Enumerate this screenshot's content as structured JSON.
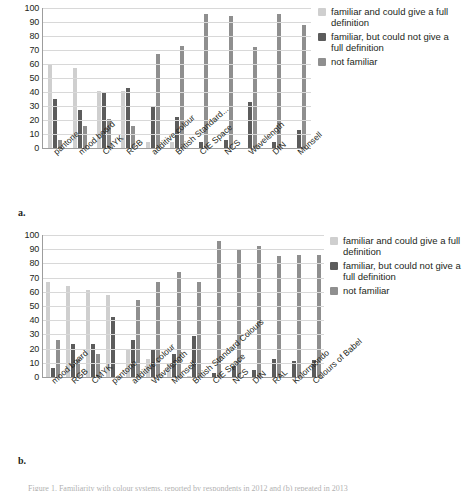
{
  "figure": {
    "panel_a_label": "a.",
    "panel_b_label": "b.",
    "caption": "Figure 1. Familiarity with colour systems, reported by respondents in 2012 and (b) repeated in 2013"
  },
  "legend": {
    "series": [
      {
        "label": "familiar and could give a full definition",
        "color": "#cfcfcf"
      },
      {
        "label": "familiar, but could not give a full definition",
        "color": "#5c5c5c"
      },
      {
        "label": "not familiar",
        "color": "#8f8f8f"
      }
    ]
  },
  "yaxis": {
    "ticks": [
      "100",
      "90",
      "80",
      "70",
      "60",
      "50",
      "40",
      "30",
      "20",
      "10",
      "0"
    ]
  },
  "chart_data": [
    {
      "type": "bar",
      "title": "",
      "panel": "a",
      "xlabel": "",
      "ylabel": "",
      "ylim": [
        0,
        100
      ],
      "grid": true,
      "legend_position": "right",
      "categories": [
        "pantone",
        "mood board",
        "CMYK",
        "RGB",
        "additive colour",
        "British Standard...",
        "CIE Space",
        "NCS",
        "Wavelength",
        "DIN",
        "Munsell"
      ],
      "series": [
        {
          "name": "familiar and could give a full definition",
          "color": "#cfcfcf",
          "values": [
            59,
            57,
            41,
            41,
            4,
            4,
            0,
            0,
            0,
            0,
            0
          ]
        },
        {
          "name": "familiar, but could not give a full definition",
          "color": "#5c5c5c",
          "values": [
            35,
            27,
            39,
            43,
            29,
            22,
            4,
            6,
            33,
            4,
            13
          ]
        },
        {
          "name": "not familiar",
          "color": "#8f8f8f",
          "values": [
            6,
            16,
            21,
            16,
            67,
            73,
            96,
            94,
            72,
            96,
            88
          ]
        }
      ]
    },
    {
      "type": "bar",
      "title": "",
      "panel": "b",
      "xlabel": "",
      "ylabel": "",
      "ylim": [
        0,
        100
      ],
      "grid": true,
      "legend_position": "right",
      "categories": [
        "mood board",
        "RGB",
        "CMYK",
        "pantone",
        "additive colour",
        "Wavelength",
        "Munsell",
        "British Standard Colours",
        "CIE Space",
        "NCS",
        "DIN",
        "RAL",
        "Kolormondo",
        "Colours of Babel"
      ],
      "series": [
        {
          "name": "familiar and could give a full definition",
          "color": "#cfcfcf",
          "values": [
            67,
            64,
            61,
            58,
            20,
            13,
            9,
            1,
            0,
            0,
            0,
            0,
            0,
            0
          ]
        },
        {
          "name": "familiar, but could not give a full definition",
          "color": "#5c5c5c",
          "values": [
            6,
            23,
            23,
            42,
            26,
            20,
            16,
            29,
            3,
            8,
            5,
            13,
            11,
            12
          ]
        },
        {
          "name": "not familiar",
          "color": "#8f8f8f",
          "values": [
            26,
            13,
            16,
            0,
            54,
            67,
            74,
            67,
            96,
            90,
            92,
            85,
            86,
            86
          ]
        }
      ]
    }
  ]
}
